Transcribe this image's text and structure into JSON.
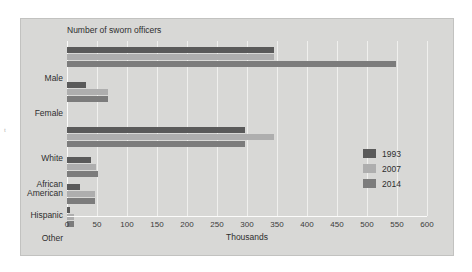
{
  "chart_data": {
    "type": "bar",
    "orientation": "horizontal",
    "title": "Number of sworn officers",
    "xlabel": "Thousands",
    "ylabel": "",
    "xlim": [
      0,
      600
    ],
    "xticks": [
      0,
      50,
      100,
      150,
      200,
      250,
      300,
      350,
      400,
      450,
      500,
      550,
      600
    ],
    "grid": true,
    "legend_position": "right-inside",
    "categories": [
      "Male",
      "Female",
      "White",
      "African American",
      "Hispanic",
      "Other"
    ],
    "series": [
      {
        "name": "1993",
        "color": "#5a5a5a",
        "values": [
          345,
          32,
          297,
          40,
          22,
          5
        ]
      },
      {
        "name": "2007",
        "color": "#aeaeae",
        "values": [
          345,
          68,
          345,
          48,
          46,
          11
        ]
      },
      {
        "name": "2014",
        "color": "#7c7c7c",
        "values": [
          548,
          68,
          297,
          52,
          47,
          12
        ]
      }
    ]
  },
  "figure": {
    "background": "#d8d8d6",
    "scan_artifact": "t"
  }
}
